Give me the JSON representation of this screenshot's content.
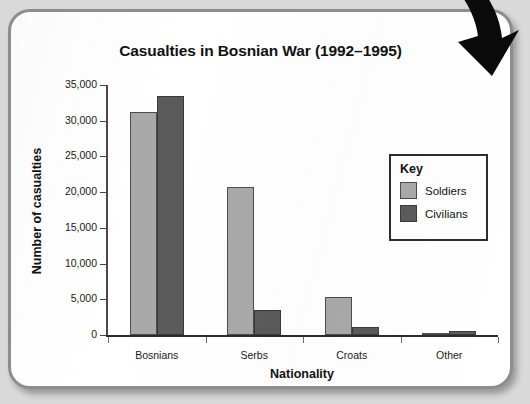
{
  "chart_data": {
    "type": "bar",
    "title": "Casualties in Bosnian War (1992–1995)",
    "xlabel": "Nationality",
    "ylabel": "Number of casualties",
    "categories": [
      "Bosnians",
      "Serbs",
      "Croats",
      "Other"
    ],
    "series": [
      {
        "name": "Soldiers",
        "color": "#a9a9a9",
        "values": [
          31200,
          20700,
          5300,
          150
        ]
      },
      {
        "name": "Civilians",
        "color": "#5b5b5b",
        "values": [
          33400,
          3500,
          1100,
          500
        ]
      }
    ],
    "ylim": [
      0,
      35000
    ],
    "ytick_labels": [
      "0",
      "5,000",
      "10,000",
      "15,000",
      "20,000",
      "25,000",
      "30,000",
      "35,000"
    ],
    "ytick_values": [
      0,
      5000,
      10000,
      15000,
      20000,
      25000,
      30000,
      35000
    ],
    "grid": false,
    "legend": {
      "title": "Key",
      "position": "inside-top-right",
      "entries": [
        "Soldiers",
        "Civilians"
      ]
    }
  },
  "legend": {
    "title": "Key",
    "rows": [
      {
        "label": "Soldiers"
      },
      {
        "label": "Civilians"
      }
    ]
  },
  "decorations": {
    "corner_arrow": "curved-arrow-icon"
  },
  "colors": {
    "soldiers": "#a9a9a9",
    "civilians": "#5b5b5b",
    "frame": "#8d8d8d",
    "page": "#ffffff",
    "backdrop": "#d9d9d9"
  }
}
